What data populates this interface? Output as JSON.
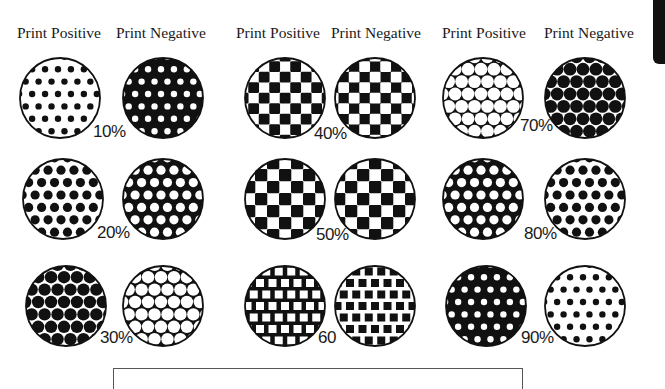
{
  "headers": [
    {
      "label": "Print Positive",
      "x": 17
    },
    {
      "label": "Print Negative",
      "x": 116
    },
    {
      "label": "Print Positive",
      "x": 236
    },
    {
      "label": "Print Negative",
      "x": 331
    },
    {
      "label": "Print Positive",
      "x": 442
    },
    {
      "label": "Print Negative",
      "x": 544
    }
  ],
  "colors": {
    "ink": "#111111",
    "paper": "#ffffff",
    "text": "#1a1a1a"
  },
  "swatches": [
    {
      "id": "10-pos",
      "cx": 60,
      "cy": 98,
      "r": 40,
      "bg": "paper",
      "pattern": "dots",
      "mark": "ink",
      "size": 3.2
    },
    {
      "id": "10-neg",
      "cx": 163,
      "cy": 98,
      "r": 40,
      "bg": "ink",
      "pattern": "dots",
      "mark": "paper",
      "size": 3.2
    },
    {
      "id": "20-pos",
      "cx": 63,
      "cy": 199,
      "r": 40,
      "bg": "paper",
      "pattern": "dots",
      "mark": "ink",
      "size": 4.6
    },
    {
      "id": "20-neg",
      "cx": 163,
      "cy": 199,
      "r": 40,
      "bg": "ink",
      "pattern": "dots",
      "mark": "paper",
      "size": 4.6
    },
    {
      "id": "30-pos",
      "cx": 66,
      "cy": 306,
      "r": 40,
      "bg": "paper",
      "pattern": "dots",
      "mark": "ink",
      "size": 6.2
    },
    {
      "id": "30-neg",
      "cx": 163,
      "cy": 306,
      "r": 40,
      "bg": "ink",
      "pattern": "dots",
      "mark": "paper",
      "size": 6.2
    },
    {
      "id": "40-pos",
      "cx": 285,
      "cy": 98,
      "r": 40,
      "bg": "paper",
      "pattern": "checker",
      "mark": "ink",
      "size": 10.5
    },
    {
      "id": "40-neg",
      "cx": 375,
      "cy": 98,
      "r": 40,
      "bg": "ink",
      "pattern": "checker",
      "mark": "paper",
      "size": 10.5
    },
    {
      "id": "50-pos",
      "cx": 285,
      "cy": 199,
      "r": 40,
      "bg": "paper",
      "pattern": "checker",
      "mark": "ink",
      "size": 12
    },
    {
      "id": "50-neg",
      "cx": 375,
      "cy": 199,
      "r": 40,
      "bg": "paper",
      "pattern": "checker",
      "mark": "ink",
      "size": 12,
      "offset": 1
    },
    {
      "id": "60-pos",
      "cx": 285,
      "cy": 306,
      "r": 40,
      "bg": "ink",
      "pattern": "checker",
      "mark": "paper",
      "size": 8
    },
    {
      "id": "60-neg",
      "cx": 375,
      "cy": 306,
      "r": 40,
      "bg": "paper",
      "pattern": "checker",
      "mark": "ink",
      "size": 8
    },
    {
      "id": "70-pos",
      "cx": 483,
      "cy": 98,
      "r": 40,
      "bg": "ink",
      "pattern": "dots",
      "mark": "paper",
      "size": 6.4
    },
    {
      "id": "70-neg",
      "cx": 585,
      "cy": 98,
      "r": 40,
      "bg": "paper",
      "pattern": "dots",
      "mark": "ink",
      "size": 6.4
    },
    {
      "id": "80-pos",
      "cx": 483,
      "cy": 199,
      "r": 40,
      "bg": "ink",
      "pattern": "dots",
      "mark": "paper",
      "size": 4.6
    },
    {
      "id": "80-neg",
      "cx": 585,
      "cy": 199,
      "r": 40,
      "bg": "paper",
      "pattern": "dots",
      "mark": "ink",
      "size": 4.6
    },
    {
      "id": "90-pos",
      "cx": 486,
      "cy": 306,
      "r": 40,
      "bg": "ink",
      "pattern": "dots",
      "mark": "paper",
      "size": 3.2
    },
    {
      "id": "90-neg",
      "cx": 585,
      "cy": 306,
      "r": 40,
      "bg": "paper",
      "pattern": "dots",
      "mark": "ink",
      "size": 3.2
    }
  ],
  "percent_labels": [
    {
      "text": "10%",
      "x": 93,
      "y": 128
    },
    {
      "text": "20%",
      "x": 97,
      "y": 229
    },
    {
      "text": "30%",
      "x": 100,
      "y": 334
    },
    {
      "text": "40%",
      "x": 314,
      "y": 130
    },
    {
      "text": "50%",
      "x": 316,
      "y": 231
    },
    {
      "text": "60",
      "x": 318,
      "y": 334
    },
    {
      "text": "70%",
      "x": 520,
      "y": 122
    },
    {
      "text": "80%",
      "x": 524,
      "y": 230
    },
    {
      "text": "90%",
      "x": 521,
      "y": 334
    }
  ]
}
